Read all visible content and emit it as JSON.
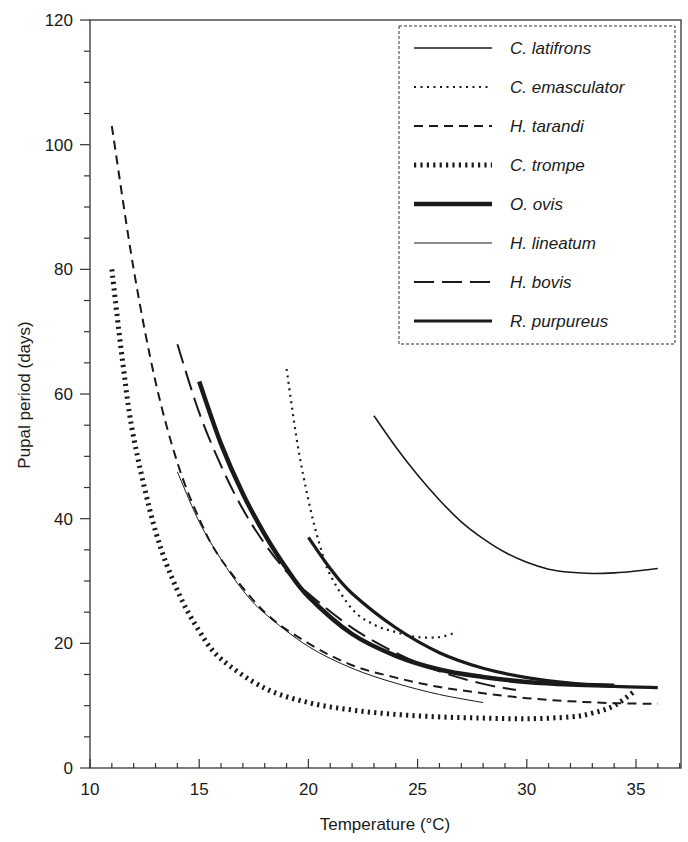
{
  "chart_data": {
    "type": "line",
    "title": "",
    "xlabel": "Temperature (°C)",
    "ylabel": "Pupal period (days)",
    "xlim": [
      10,
      37
    ],
    "ylim": [
      0,
      120
    ],
    "x_ticks": [
      10,
      15,
      20,
      25,
      30,
      35
    ],
    "y_ticks": [
      0,
      20,
      40,
      60,
      80,
      100,
      120
    ],
    "x_minor_step": 1,
    "y_minor_step": 5,
    "grid": false,
    "legend_position": "upper right",
    "legend_border": "dashed",
    "series": [
      {
        "name": "C. latifrons",
        "style": "solid",
        "width": 1.6,
        "points": [
          [
            23,
            56.5
          ],
          [
            24,
            51.5
          ],
          [
            25,
            47
          ],
          [
            26,
            43
          ],
          [
            27,
            39.5
          ],
          [
            28,
            36.8
          ],
          [
            29,
            34.6
          ],
          [
            30,
            33
          ],
          [
            31,
            31.9
          ],
          [
            32,
            31.4
          ],
          [
            33,
            31.2
          ],
          [
            34,
            31.3
          ],
          [
            35,
            31.6
          ],
          [
            36,
            32
          ]
        ]
      },
      {
        "name": "C. emasculator",
        "style": "dotted",
        "width": 2.2,
        "points": [
          [
            19,
            64
          ],
          [
            19.5,
            52
          ],
          [
            20,
            43
          ],
          [
            20.5,
            36
          ],
          [
            21,
            31
          ],
          [
            22,
            25.5
          ],
          [
            23,
            23
          ],
          [
            24,
            21.8
          ],
          [
            25,
            21
          ],
          [
            26,
            21
          ],
          [
            26.8,
            21.8
          ]
        ]
      },
      {
        "name": "H. tarandi",
        "style": "dashed",
        "width": 2,
        "points": [
          [
            11,
            103
          ],
          [
            12,
            80
          ],
          [
            13,
            62
          ],
          [
            14,
            49
          ],
          [
            15,
            40
          ],
          [
            16,
            33.5
          ],
          [
            18,
            25
          ],
          [
            20,
            20
          ],
          [
            22,
            16.5
          ],
          [
            24,
            14.5
          ],
          [
            26,
            13
          ],
          [
            28,
            12
          ],
          [
            30,
            11.2
          ],
          [
            32,
            10.7
          ],
          [
            34,
            10.4
          ],
          [
            36,
            10.3
          ]
        ]
      },
      {
        "name": "C. trompe",
        "style": "hatched",
        "width": 5,
        "points": [
          [
            11,
            80
          ],
          [
            11.5,
            65
          ],
          [
            12,
            53
          ],
          [
            13,
            38
          ],
          [
            14,
            28.5
          ],
          [
            15,
            22
          ],
          [
            16,
            17.5
          ],
          [
            18,
            12.8
          ],
          [
            20,
            10.5
          ],
          [
            22,
            9.3
          ],
          [
            24,
            8.6
          ],
          [
            26,
            8.2
          ],
          [
            28,
            8.0
          ],
          [
            30,
            7.9
          ],
          [
            32,
            8.2
          ],
          [
            33,
            8.8
          ],
          [
            34,
            10
          ],
          [
            35,
            12.5
          ]
        ]
      },
      {
        "name": "O. ovis",
        "style": "solid-thick",
        "width": 4.5,
        "points": [
          [
            15,
            62
          ],
          [
            16,
            52
          ],
          [
            17,
            44
          ],
          [
            18,
            37.5
          ],
          [
            19,
            32
          ],
          [
            20,
            27.5
          ],
          [
            22,
            21.5
          ],
          [
            24,
            18
          ],
          [
            26,
            15.8
          ],
          [
            28,
            14.6
          ],
          [
            30,
            13.8
          ],
          [
            32,
            13.4
          ],
          [
            34,
            13.2
          ]
        ]
      },
      {
        "name": "H. lineatum",
        "style": "solid-thin",
        "width": 1,
        "points": [
          [
            14,
            47.5
          ],
          [
            15,
            39.5
          ],
          [
            16,
            33.5
          ],
          [
            17,
            28.5
          ],
          [
            18,
            24.8
          ],
          [
            20,
            19.5
          ],
          [
            22,
            16
          ],
          [
            24,
            13.6
          ],
          [
            26,
            11.8
          ],
          [
            28,
            10.5
          ]
        ]
      },
      {
        "name": "H. bovis",
        "style": "long-dash",
        "width": 2,
        "points": [
          [
            14,
            68
          ],
          [
            15,
            57
          ],
          [
            16,
            48.5
          ],
          [
            17,
            41.5
          ],
          [
            18,
            36
          ],
          [
            19,
            31.5
          ],
          [
            20,
            28
          ],
          [
            22,
            22.5
          ],
          [
            24,
            18.5
          ],
          [
            26,
            15.5
          ],
          [
            28,
            13.5
          ],
          [
            29.5,
            12.5
          ]
        ]
      },
      {
        "name": "R. purpureus",
        "style": "solid-medium",
        "width": 3.2,
        "points": [
          [
            20,
            37
          ],
          [
            21,
            32
          ],
          [
            22,
            28
          ],
          [
            24,
            22.5
          ],
          [
            26,
            18.5
          ],
          [
            28,
            16
          ],
          [
            30,
            14.5
          ],
          [
            32,
            13.6
          ],
          [
            34,
            13.1
          ],
          [
            36,
            12.9
          ]
        ]
      }
    ]
  },
  "axes": {
    "x_title": "Temperature (°C)",
    "y_title": "Pupal period (days)",
    "x_tick_labels": [
      "10",
      "15",
      "20",
      "25",
      "30",
      "35"
    ],
    "y_tick_labels": [
      "0",
      "20",
      "40",
      "60",
      "80",
      "100",
      "120"
    ]
  },
  "legend": {
    "items": [
      {
        "label": "C. latifrons",
        "style": "solid"
      },
      {
        "label": "C. emasculator",
        "style": "dotted"
      },
      {
        "label": "H. tarandi",
        "style": "dashed"
      },
      {
        "label": "C. trompe",
        "style": "hatched"
      },
      {
        "label": "O. ovis",
        "style": "solid-thick"
      },
      {
        "label": "H. lineatum",
        "style": "solid-thin"
      },
      {
        "label": "H. bovis",
        "style": "long-dash"
      },
      {
        "label": "R. purpureus",
        "style": "solid-medium"
      }
    ]
  },
  "colors": {
    "ink": "#1a1a1a",
    "axis": "#333333",
    "background": "#ffffff"
  }
}
